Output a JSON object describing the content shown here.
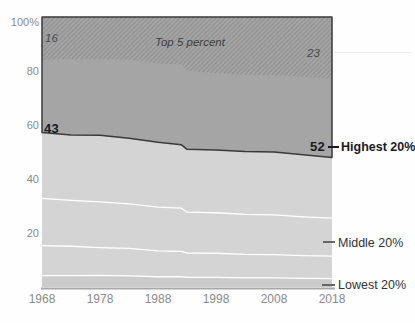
{
  "figure": {
    "annotations": {
      "top5_label": "Top 5 percent",
      "top5_start_value": "16",
      "top5_end_value": "23",
      "highest_start_value": "43",
      "highest_end_value": "52",
      "right_labels": {
        "highest": "Highest 20%",
        "middle": "Middle 20%",
        "lowest": "Lowest 20%"
      }
    },
    "colors": {
      "highest_area": "#a5a5a5",
      "hatch_line": "#8d8d8d",
      "lower_area": "#d4d4d4",
      "lowest_band": "#cbcbcb",
      "boundary_dark": "#3a3a3a",
      "separator_white": "#ffffff",
      "axis_line": "#a8a8a8",
      "axis_text": "#8a8a8a"
    }
  },
  "chart_data": {
    "type": "area",
    "title": "",
    "xlabel": "",
    "ylabel": "",
    "ylim": [
      0,
      100
    ],
    "xlim": [
      1968,
      2018
    ],
    "grid": false,
    "legend_position": "right-annotations",
    "y_ticks": [
      "100%",
      "80",
      "60",
      "40",
      "20"
    ],
    "x_ticks": [
      "1968",
      "1978",
      "1988",
      "1998",
      "2008",
      "2018"
    ],
    "years": [
      1968,
      1973,
      1978,
      1983,
      1988,
      1992,
      1993,
      1998,
      2003,
      2008,
      2013,
      2018
    ],
    "series": [
      {
        "name": "Lowest 20%",
        "values": [
          4.2,
          4.2,
          4.3,
          4.1,
          3.8,
          3.8,
          3.6,
          3.6,
          3.4,
          3.4,
          3.2,
          3.1
        ]
      },
      {
        "name": "Second 20%",
        "values": [
          11.1,
          10.9,
          10.3,
          10.2,
          9.6,
          9.4,
          9.0,
          8.9,
          8.7,
          8.6,
          8.4,
          8.3
        ]
      },
      {
        "name": "Middle 20%",
        "values": [
          17.5,
          17.0,
          16.9,
          16.5,
          16.2,
          16.0,
          15.1,
          15.0,
          14.8,
          14.7,
          14.4,
          14.1
        ]
      },
      {
        "name": "Fourth 20%",
        "values": [
          24.4,
          24.2,
          24.7,
          24.3,
          24.0,
          23.5,
          23.3,
          23.2,
          23.3,
          23.3,
          23.0,
          22.5
        ]
      },
      {
        "name": "Highest 20%",
        "values": [
          42.8,
          43.7,
          43.8,
          44.9,
          46.4,
          47.3,
          49.0,
          49.3,
          49.8,
          50.0,
          51.0,
          52.0
        ]
      },
      {
        "name": "Top 5 percent",
        "values": [
          16.0,
          15.6,
          15.5,
          15.9,
          17.2,
          17.6,
          20.0,
          20.7,
          21.4,
          21.5,
          22.2,
          23.0
        ]
      }
    ],
    "annotated_values": {
      "top5_1968": 16,
      "top5_2018": 23,
      "highest20_1968": 43,
      "highest20_2018": 52
    }
  }
}
